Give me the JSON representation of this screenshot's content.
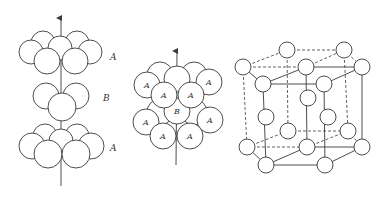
{
  "figure": {
    "panels": [
      {
        "id": "abab-stacking-exploded",
        "layer_labels": [
          "A",
          "B",
          "A"
        ]
      },
      {
        "id": "abab-stacking-compact",
        "ball_labels": {
          "top_layer": [
            "A",
            "A",
            "A",
            "A"
          ],
          "middle_layer": [
            "B"
          ],
          "bottom_layer": [
            "A",
            "A",
            "A",
            "A"
          ]
        }
      },
      {
        "id": "hcp-unit-cell",
        "description": "hexagonal close-packed unit cell"
      }
    ],
    "colors": {
      "line": "#3a3a3a",
      "fill": "#ffffff",
      "background": "#ffffff"
    }
  }
}
